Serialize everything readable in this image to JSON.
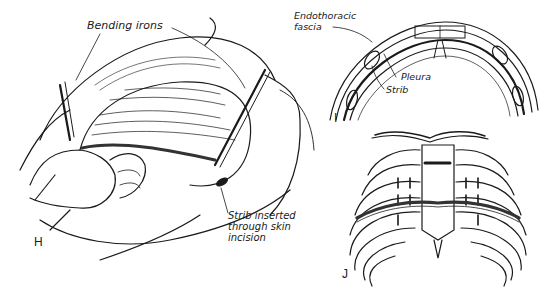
{
  "figure": {
    "panels": [
      {
        "letter": "H",
        "description": "Surgical view of anterior chest with bending irons and strut inserted through skin incision"
      },
      {
        "letter": "I",
        "description": "Cross-section of anterior chest wall showing strut beneath sternum"
      },
      {
        "letter": "J",
        "description": "Rib cage with strut placed across anterior chest"
      }
    ],
    "labels": {
      "bending_irons": "Bending irons",
      "endothoracic_fascia_line1": "Endothoracic",
      "endothoracic_fascia_line2": "fascia",
      "pleura": "Pleura",
      "strib": "Strib",
      "strib_inserted_line1": "Strib inserted",
      "strib_inserted_line2": "through skin",
      "strib_inserted_line3": "incision"
    },
    "colors": {
      "ink": "#1a1a1a",
      "paper": "#ffffff"
    }
  }
}
